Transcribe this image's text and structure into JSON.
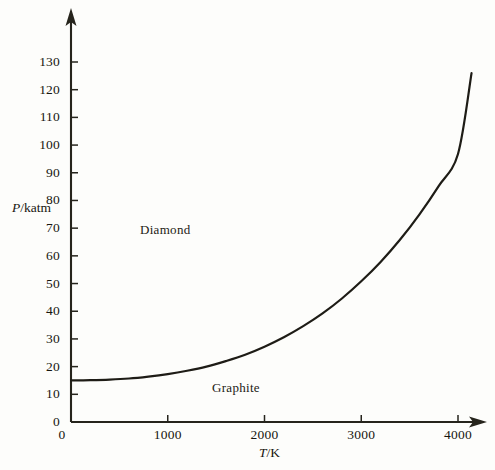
{
  "figure": {
    "background_color": "#fdfdfb",
    "axis_color": "#26241c",
    "curve_color": "#1e1c16"
  },
  "axes": {
    "y": {
      "title_prefix": "P",
      "title_suffix": "/katm",
      "title_full": "P/katm",
      "ticks": [
        0,
        10,
        20,
        30,
        40,
        50,
        60,
        70,
        80,
        90,
        100,
        110,
        120,
        130
      ],
      "tick_labels": [
        "0",
        "10",
        "20",
        "30",
        "40",
        "50",
        "60",
        "70",
        "80",
        "90",
        "100",
        "110",
        "120",
        "130"
      ],
      "range": [
        0,
        136
      ],
      "has_arrow": true
    },
    "x": {
      "title_prefix": "T",
      "title_suffix": "/K",
      "title_full": "T/K",
      "ticks": [
        0,
        1000,
        2000,
        3000,
        4000
      ],
      "tick_labels": [
        "0",
        "1000",
        "2000",
        "3000",
        "4000"
      ],
      "range": [
        0,
        4380
      ],
      "has_arrow": true
    }
  },
  "regions": [
    {
      "name": "diamond-region-label",
      "label": "Diamond"
    },
    {
      "name": "graphite-region-label",
      "label": "Graphite"
    }
  ],
  "chart_data": {
    "type": "line",
    "title": "",
    "xlabel": "T/K",
    "ylabel": "P/katm",
    "xlim": [
      0,
      4380
    ],
    "ylim": [
      0,
      136
    ],
    "grid": false,
    "legend": "none",
    "series": [
      {
        "name": "graphite-diamond phase boundary",
        "x": [
          0,
          200,
          400,
          600,
          800,
          1000,
          1200,
          1400,
          1600,
          1800,
          2000,
          2200,
          2400,
          2600,
          2800,
          3000,
          3200,
          3400,
          3600,
          3800,
          4000,
          4140
        ],
        "y": [
          15.0,
          15.1,
          15.3,
          15.7,
          16.4,
          17.3,
          18.5,
          20.0,
          22.0,
          24.3,
          27.2,
          30.6,
          34.6,
          39.2,
          44.6,
          50.8,
          57.8,
          65.8,
          74.9,
          85.2,
          96.8,
          126.0
        ]
      }
    ],
    "annotations": [
      {
        "text": "Diamond",
        "x": 1100,
        "y": 71
      },
      {
        "text": "Graphite",
        "x": 1950,
        "y": 11
      }
    ]
  }
}
